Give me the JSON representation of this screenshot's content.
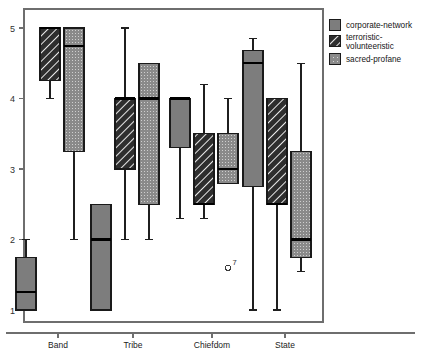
{
  "chart_data": {
    "type": "box",
    "title": "",
    "xlabel": "",
    "ylabel": "",
    "categories": [
      "Band",
      "Tribe",
      "Chiefdom",
      "State"
    ],
    "ylim": [
      1,
      5
    ],
    "yticks": [
      1,
      2,
      3,
      4,
      5
    ],
    "ytick_labels": [
      "1",
      "2",
      "3",
      "4",
      "5"
    ],
    "grid": false,
    "legend_position": "right",
    "series": [
      {
        "name": "corporate-network",
        "fill": "solid-gray",
        "color": "#7d7d7d",
        "boxes": [
          {
            "category": "Band",
            "whisker_low": 1.0,
            "q1": 1.0,
            "median": 1.25,
            "q3": 1.75,
            "whisker_high": 2.0
          },
          {
            "category": "Tribe",
            "whisker_low": 1.0,
            "q1": 1.0,
            "median": 2.0,
            "q3": 2.5,
            "whisker_high": 2.5
          },
          {
            "category": "Chiefdom",
            "whisker_low": 2.3,
            "q1": 3.3,
            "median": 4.0,
            "q3": 4.0,
            "whisker_high": 4.0
          },
          {
            "category": "State",
            "whisker_low": 1.0,
            "q1": 2.75,
            "median": 4.5,
            "q3": 4.68,
            "whisker_high": 4.85
          }
        ]
      },
      {
        "name": "terroristic-volunteeristic",
        "fill": "diagonal-hatch",
        "color": "#2b2b2b",
        "boxes": [
          {
            "category": "Band",
            "whisker_low": 4.0,
            "q1": 4.25,
            "median": 5.0,
            "q3": 5.0,
            "whisker_high": 5.0
          },
          {
            "category": "Tribe",
            "whisker_low": 2.0,
            "q1": 3.0,
            "median": 4.0,
            "q3": 4.0,
            "whisker_high": 5.0
          },
          {
            "category": "Chiefdom",
            "whisker_low": 2.3,
            "q1": 2.5,
            "median": 2.5,
            "q3": 3.5,
            "whisker_high": 4.2
          },
          {
            "category": "State",
            "whisker_low": 1.0,
            "q1": 2.5,
            "median": 2.5,
            "q3": 4.0,
            "whisker_high": 4.0
          }
        ]
      },
      {
        "name": "sacred-profane",
        "fill": "dotted-gray",
        "color": "#8a8a8a",
        "boxes": [
          {
            "category": "Band",
            "whisker_low": 2.0,
            "q1": 3.25,
            "median": 4.75,
            "q3": 5.0,
            "whisker_high": 5.0
          },
          {
            "category": "Tribe",
            "whisker_low": 2.0,
            "q1": 2.5,
            "median": 4.0,
            "q3": 4.5,
            "whisker_high": 4.5
          },
          {
            "category": "Chiefdom",
            "whisker_low": 2.8,
            "q1": 2.8,
            "median": 3.0,
            "q3": 3.5,
            "whisker_high": 4.0
          },
          {
            "category": "State",
            "whisker_low": 1.55,
            "q1": 1.75,
            "median": 2.0,
            "q3": 3.25,
            "whisker_high": 4.5
          }
        ]
      }
    ],
    "outliers": [
      {
        "label": "7",
        "category": "Chiefdom",
        "series": "sacred-profane",
        "value": 1.6
      }
    ],
    "legend": [
      {
        "label": "corporate-network",
        "swatch": "solid-gray"
      },
      {
        "label": "terroristic-",
        "label2": "volunteeristic",
        "swatch": "diagonal-hatch"
      },
      {
        "label": "sacred-profane",
        "swatch": "dotted-gray"
      }
    ]
  },
  "axes": {
    "y_tick_1": "1",
    "y_tick_2": "2",
    "y_tick_3": "3",
    "y_tick_4": "4",
    "y_tick_5": "5",
    "cat_1": "Band",
    "cat_2": "Tribe",
    "cat_3": "Chiefdom",
    "cat_4": "State"
  },
  "legend": {
    "item_1": "corporate-network",
    "item_2_line1": "terroristic-",
    "item_2_line2": "volunteeristic",
    "item_3": "sacred-profane"
  },
  "annotations": {
    "outlier_label": "7"
  }
}
